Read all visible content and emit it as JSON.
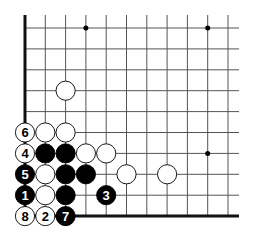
{
  "board": {
    "grid": {
      "x0": 25,
      "dx": 20.3,
      "cols": 11,
      "y0": 28,
      "dy": 20.9,
      "rows": 10,
      "line_right": 239,
      "line_top": 15,
      "line_color": "#555555",
      "edge_color": "#111111"
    },
    "edges": {
      "left": {
        "x": 25,
        "y1": 15,
        "y2": 216
      },
      "bottom": {
        "y": 216,
        "x1": 25,
        "x2": 239
      }
    },
    "star_points": [
      [
        3,
        0
      ],
      [
        9,
        0
      ],
      [
        9,
        6
      ]
    ],
    "stones": [
      {
        "col": 2,
        "row": 3,
        "color": "white",
        "label": ""
      },
      {
        "col": 0,
        "row": 5,
        "color": "white",
        "label": "6"
      },
      {
        "col": 1,
        "row": 5,
        "color": "white",
        "label": ""
      },
      {
        "col": 2,
        "row": 5,
        "color": "white",
        "label": ""
      },
      {
        "col": 0,
        "row": 6,
        "color": "white",
        "label": "4"
      },
      {
        "col": 1,
        "row": 6,
        "color": "black",
        "label": ""
      },
      {
        "col": 2,
        "row": 6,
        "color": "black",
        "label": ""
      },
      {
        "col": 3,
        "row": 6,
        "color": "white",
        "label": ""
      },
      {
        "col": 4,
        "row": 6,
        "color": "white",
        "label": ""
      },
      {
        "col": 0,
        "row": 7,
        "color": "black",
        "label": "5"
      },
      {
        "col": 1,
        "row": 7,
        "color": "white",
        "label": ""
      },
      {
        "col": 2,
        "row": 7,
        "color": "black",
        "label": ""
      },
      {
        "col": 3,
        "row": 7,
        "color": "black",
        "label": ""
      },
      {
        "col": 5,
        "row": 7,
        "color": "white",
        "label": ""
      },
      {
        "col": 7,
        "row": 7,
        "color": "white",
        "label": ""
      },
      {
        "col": 0,
        "row": 8,
        "color": "black",
        "label": "1"
      },
      {
        "col": 1,
        "row": 8,
        "color": "white",
        "label": ""
      },
      {
        "col": 2,
        "row": 8,
        "color": "black",
        "label": ""
      },
      {
        "col": 4,
        "row": 8,
        "color": "black",
        "label": "3"
      },
      {
        "col": 0,
        "row": 9,
        "color": "white",
        "label": "8"
      },
      {
        "col": 1,
        "row": 9,
        "color": "white",
        "label": "2"
      },
      {
        "col": 2,
        "row": 9,
        "color": "black",
        "label": "7"
      }
    ]
  }
}
